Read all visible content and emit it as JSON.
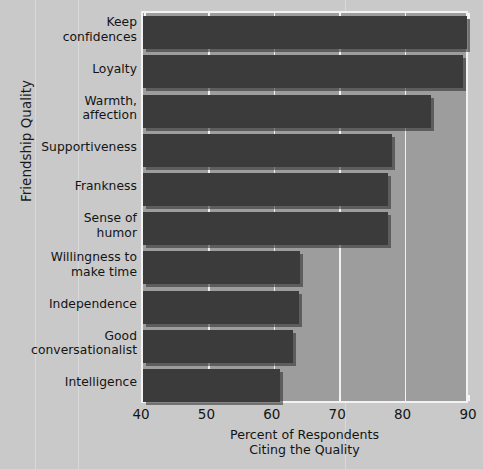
{
  "chart_data": {
    "type": "bar",
    "orientation": "horizontal",
    "title": "",
    "xlabel": "Percent of Respondents Citing the Quality",
    "xlabel_lines": [
      "Percent of Respondents",
      "Citing the Quality"
    ],
    "ylabel": "Friendship Quality",
    "categories": [
      "Keep confidences",
      "Loyalty",
      "Warmth, affection",
      "Supportiveness",
      "Frankness",
      "Sense of humor",
      "Willingness to make time",
      "Independence",
      "Good conversationalist",
      "Intelligence"
    ],
    "category_lines": [
      [
        "Keep",
        "confidences"
      ],
      [
        "Loyalty"
      ],
      [
        "Warmth,",
        "affection"
      ],
      [
        "Supportiveness"
      ],
      [
        "Frankness"
      ],
      [
        "Sense of",
        "humor"
      ],
      [
        "Willingness to",
        "make time"
      ],
      [
        "Independence"
      ],
      [
        "Good",
        "conversationalist"
      ],
      [
        "Intelligence"
      ]
    ],
    "values": [
      89.5,
      89,
      84,
      78,
      77.5,
      77.5,
      64,
      63.8,
      63,
      61
    ],
    "xlim": [
      40,
      90
    ],
    "xticks": [
      40,
      50,
      60,
      70,
      80,
      90
    ],
    "grid": true,
    "legend": null,
    "colors": {
      "bar": "#3b3b3b",
      "plot_background": "#9d9d9d",
      "figure_background": "#c9c9c9",
      "gridline": "#f0f0f0",
      "axis_border": "#f2f2f2",
      "text": "#141414"
    }
  }
}
